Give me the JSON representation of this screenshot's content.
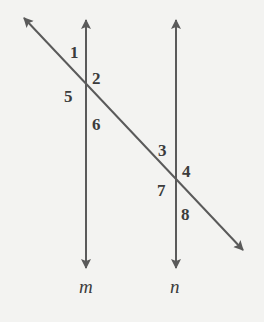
{
  "diagram": {
    "type": "parallel lines cut by a transversal",
    "line_color": "#5a5a5a",
    "background": "#f3f3f1",
    "lines": [
      {
        "name": "m",
        "label": "m",
        "type": "vertical-double-arrow"
      },
      {
        "name": "n",
        "label": "n",
        "type": "vertical-double-arrow"
      },
      {
        "name": "transversal",
        "type": "diagonal-double-arrow"
      }
    ],
    "angles": [
      {
        "id": 1,
        "label": "1"
      },
      {
        "id": 2,
        "label": "2"
      },
      {
        "id": 3,
        "label": "3"
      },
      {
        "id": 4,
        "label": "4"
      },
      {
        "id": 5,
        "label": "5"
      },
      {
        "id": 6,
        "label": "6"
      },
      {
        "id": 7,
        "label": "7"
      },
      {
        "id": 8,
        "label": "8"
      }
    ]
  }
}
